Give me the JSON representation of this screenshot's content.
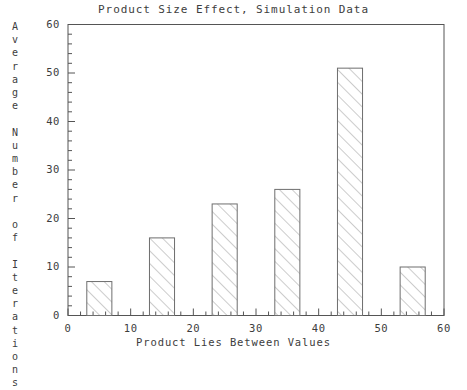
{
  "chart_data": {
    "type": "bar",
    "title": "Product Size Effect, Simulation Data",
    "xlabel": "Product Lies Between Values",
    "ylabel": "Average Number of Iterations",
    "ylabel_vertical_text": "A\nv\ne\nr\na\ng\ne\n\nN\nu\nm\nb\ne\nr\n\no\nf\n\nI\nt\ne\nr\na\nt\ni\no\nn\ns",
    "categories": [
      "5",
      "15",
      "25",
      "35",
      "45",
      "55"
    ],
    "x": [
      5,
      15,
      25,
      35,
      45,
      55
    ],
    "values": [
      7,
      16,
      23,
      26,
      51,
      10
    ],
    "bar_width": 4,
    "xlim": [
      0,
      60
    ],
    "ylim": [
      0,
      60
    ],
    "xticks": [
      0,
      10,
      20,
      30,
      40,
      50,
      60
    ],
    "yticks": [
      0,
      10,
      20,
      30,
      40,
      50,
      60
    ],
    "xtick_labels": [
      "0",
      "10",
      "20",
      "30",
      "40",
      "50",
      "60"
    ],
    "ytick_labels": [
      "0",
      "10",
      "20",
      "30",
      "40",
      "50",
      "60"
    ],
    "x_minor_tick_step": 2,
    "y_minor_tick_step": 2,
    "grid": false,
    "legend": null,
    "bar_fill": "hatch-diagonal-45",
    "colors": {
      "axis": "#555555",
      "bar_edge": "#6e6e6e",
      "bar_hatch": "#9a9a9a",
      "text": "#3d3d3d",
      "background": "#ffffff"
    }
  }
}
